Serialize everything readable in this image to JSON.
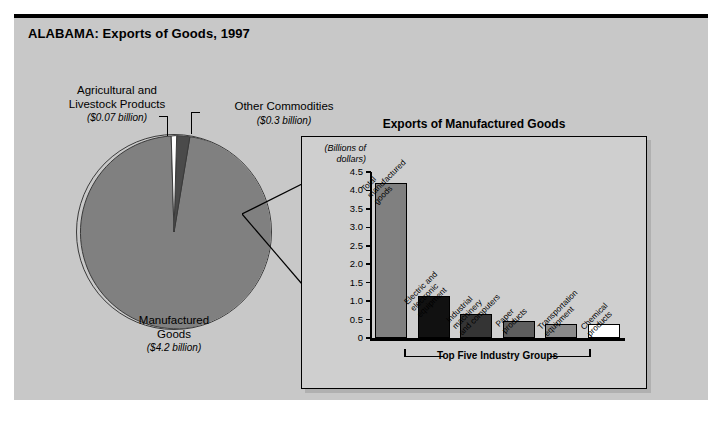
{
  "figure": {
    "title": "ALABAMA: Exports of Goods, 1997"
  },
  "pie_labels": {
    "agricultural": {
      "name": "Agricultural and Livestock Products",
      "line1": "Agricultural and",
      "line2": "Livestock Products",
      "amount": "($0.07 billion)"
    },
    "other": {
      "name": "Other Commodities",
      "line1": "Other Commodities",
      "amount": "($0.3 billion)"
    },
    "manufactured": {
      "name": "Manufactured Goods",
      "line1": "Manufactured",
      "line2": "Goods",
      "amount": "($4.2 billion)"
    }
  },
  "inset": {
    "title": "Exports of Manufactured Goods",
    "units_line1": "(Billions of",
    "units_line2": "dollars)",
    "bracket_label": "Top Five Industry Groups"
  },
  "chart_data": [
    {
      "type": "pie",
      "title": "ALABAMA: Exports of Goods, 1997",
      "unit": "billions of dollars",
      "labels": [
        "Manufactured Goods",
        "Other Commodities",
        "Agricultural and Livestock Products"
      ],
      "values": [
        4.2,
        0.3,
        0.07
      ],
      "value_labels": [
        "($4.2 billion)",
        "($0.3 billion)",
        "($0.07 billion)"
      ],
      "colors": [
        "#808080",
        "#4a4a4a",
        "#ffffff"
      ],
      "legend": "none"
    },
    {
      "type": "bar",
      "title": "Exports of Manufactured Goods",
      "xlabel": "",
      "ylabel": "(Billions of dollars)",
      "ylim": [
        0,
        4.5
      ],
      "yticks": [
        "0",
        "0.5",
        "1.0",
        "1.5",
        "2.0",
        "2.5",
        "3.0",
        "3.5",
        "4.0",
        "4.5"
      ],
      "ytick_values": [
        0,
        0.5,
        1.0,
        1.5,
        2.0,
        2.5,
        3.0,
        3.5,
        4.0,
        4.5
      ],
      "grid": false,
      "legend": "none",
      "categories": [
        "Total manufactured goods",
        "Electric and electronic equipment",
        "Industrial machinery and computers",
        "Paper products",
        "Transportation equipment",
        "Chemical products"
      ],
      "category_lines": [
        [
          "Total",
          "manufactured",
          "goods"
        ],
        [
          "Electric and",
          "electronic",
          "equipment"
        ],
        [
          "Industrial",
          "machinery",
          "and computers"
        ],
        [
          "Paper",
          "products"
        ],
        [
          "Transportation",
          "equipment"
        ],
        [
          "Chemical",
          "products"
        ]
      ],
      "values": [
        4.2,
        1.15,
        0.65,
        0.45,
        0.38,
        0.37
      ],
      "bar_colors": [
        "#808080",
        "#111111",
        "#343434",
        "#5e5e5e",
        "#8a8a8a",
        "#ffffff"
      ],
      "annotations": [
        "Top Five Industry Groups"
      ]
    }
  ]
}
